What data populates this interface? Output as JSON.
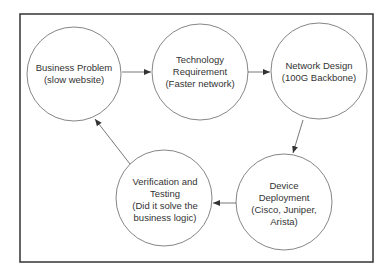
{
  "diagram": {
    "type": "cycle-flowchart",
    "nodes": [
      {
        "id": "n1",
        "lines": [
          "Business Problem",
          "(slow website)"
        ]
      },
      {
        "id": "n2",
        "lines": [
          "Technology",
          "Requirement",
          "(Faster network)"
        ]
      },
      {
        "id": "n3",
        "lines": [
          "Network Design",
          "(100G Backbone)"
        ]
      },
      {
        "id": "n4",
        "lines": [
          "Device",
          "Deployment",
          "(Cisco, Juniper,",
          "Arista)"
        ]
      },
      {
        "id": "n5",
        "lines": [
          "Verification and",
          "Testing",
          "(Did it solve the",
          "business logic)"
        ]
      }
    ],
    "edges": [
      {
        "from": "n1",
        "to": "n2"
      },
      {
        "from": "n2",
        "to": "n3"
      },
      {
        "from": "n3",
        "to": "n4"
      },
      {
        "from": "n4",
        "to": "n5"
      },
      {
        "from": "n5",
        "to": "n1"
      }
    ],
    "colors": {
      "stroke": "#555555",
      "frame": "#333333",
      "text": "#333333"
    }
  }
}
